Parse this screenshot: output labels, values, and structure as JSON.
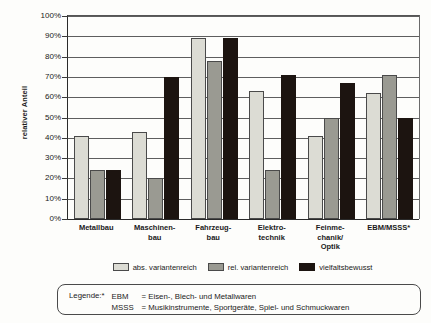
{
  "chart_data": {
    "type": "bar",
    "title": "",
    "xlabel": "",
    "ylabel": "relativer Anteil",
    "ylim": [
      0,
      100
    ],
    "yunit": "%",
    "grid": true,
    "legend_position": "bottom",
    "categories": [
      "Metallbau",
      "Maschinen-\nbau",
      "Fahrzeug-\nbau",
      "Elektro-\ntechnik",
      "Feinme-\nchanik/\nOptik",
      "EBM/MSSS*"
    ],
    "category_lines": [
      [
        "Metallbau"
      ],
      [
        "Maschinen-",
        "bau"
      ],
      [
        "Fahrzeug-",
        "bau"
      ],
      [
        "Elektro-",
        "technik"
      ],
      [
        "Feinme-",
        "chanik/",
        "Optik"
      ],
      [
        "EBM/MSSS*"
      ]
    ],
    "yticks": [
      "0%",
      "10%",
      "20%",
      "30%",
      "40%",
      "50%",
      "60%",
      "70%",
      "80%",
      "90%",
      "100%"
    ],
    "ytick_values": [
      0,
      10,
      20,
      30,
      40,
      50,
      60,
      70,
      80,
      90,
      100
    ],
    "series": [
      {
        "name": "abs. variantenreich",
        "color": "#dcdcd4",
        "values": [
          41,
          43,
          89,
          63,
          41,
          62
        ]
      },
      {
        "name": "rel. variantenreich",
        "color": "#9a9a92",
        "values": [
          24,
          20,
          78,
          24,
          50,
          71
        ]
      },
      {
        "name": "vielfaltsbewusst",
        "color": "#1c1410",
        "values": [
          24,
          70,
          89,
          71,
          67,
          50
        ]
      }
    ]
  },
  "footnote": {
    "title": "Legende:*",
    "lines": [
      {
        "key": "EBM",
        "text": "= Eisen-, Blech- und Metallwaren"
      },
      {
        "key": "MSSS",
        "text": "= Musikinstrumente, Sportgeräte, Spiel- und Schmuckwaren"
      }
    ]
  }
}
